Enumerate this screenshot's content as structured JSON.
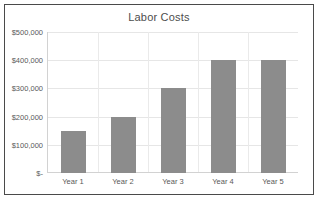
{
  "chart_data": {
    "type": "bar",
    "title": "Labor Costs",
    "xlabel": "",
    "ylabel": "",
    "categories": [
      "Year 1",
      "Year 2",
      "Year 3",
      "Year 4",
      "Year 5"
    ],
    "values": [
      150000,
      200000,
      300000,
      400000,
      400000
    ],
    "ylim": [
      0,
      500000
    ],
    "ytick_values": [
      0,
      100000,
      200000,
      300000,
      400000,
      500000
    ],
    "ytick_labels": [
      "$-",
      "$100,000",
      "$200,000",
      "$300,000",
      "$400,000",
      "$500,000"
    ],
    "grid": true,
    "legend": false,
    "legend_position": "none",
    "bar_color": "#8c8c8c",
    "gridline_color": "#e6e6e6",
    "axis_color": "#d2d2d2",
    "title_color": "#4d4d4d",
    "label_color": "#595959",
    "border_color": "#4a4a4a",
    "background_color": "#ffffff"
  }
}
